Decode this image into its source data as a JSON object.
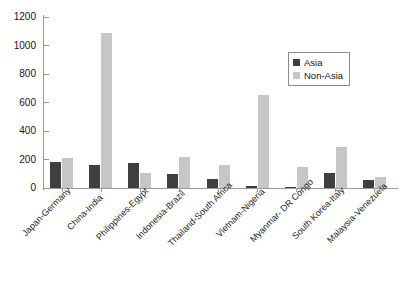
{
  "chart_data": {
    "type": "bar",
    "title": "",
    "subtitle": "",
    "xlabel": "",
    "ylabel": "",
    "ylim": [
      0,
      1200
    ],
    "ytick_step": 200,
    "yticks": [
      1200,
      1000,
      800,
      600,
      400,
      200,
      0
    ],
    "grid": false,
    "legend_position": "top-right",
    "categories": [
      "Japan-Germany",
      "China-India",
      "Philippines-Egypt",
      "Indonesia-Brazil",
      "Thailand-South Africa",
      "Vietnam-Nigeria",
      "Myanmar- DR Congo",
      "South Korea-Italy",
      "Malaysia-Venezuela"
    ],
    "series": [
      {
        "name": "Asia",
        "color": "#3f3f3f",
        "values": [
          180,
          160,
          175,
          95,
          65,
          15,
          8,
          105,
          55
        ]
      },
      {
        "name": "Non-Asia",
        "color": "#c6c6c6",
        "values": [
          210,
          1090,
          105,
          220,
          165,
          655,
          150,
          285,
          75
        ]
      }
    ]
  },
  "legend": {
    "items": [
      {
        "label": "Asia",
        "color": "#3f3f3f"
      },
      {
        "label": "Non-Asia",
        "color": "#c6c6c6"
      }
    ]
  },
  "axis": {
    "y_tick_labels": [
      "1200",
      "1000",
      "800",
      "600",
      "400",
      "200",
      "0"
    ]
  }
}
